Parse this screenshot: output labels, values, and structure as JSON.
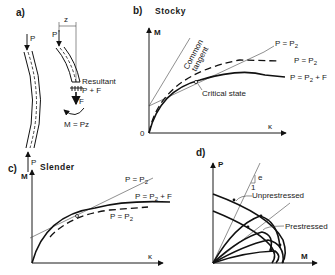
{
  "figure": {
    "panels": [
      {
        "id": "a",
        "label": "a)",
        "annotations": {
          "load_top_left": "P",
          "load_bottom_left": "P",
          "load_top_right": "P",
          "eccentricity": "z",
          "resultant": "Resultant",
          "resultant_value": "P + F",
          "force": "F",
          "moment": "M = Pz"
        }
      },
      {
        "id": "b",
        "label": "b)",
        "title": "Stocky",
        "y_axis": "M",
        "x_axis": "κ",
        "origin": "0",
        "tangent_label_line1": "Common",
        "tangent_label_line2": "tangent",
        "critical_label": "Critical state",
        "curve_labels": {
          "thin": "P = P",
          "thin_sub": "2",
          "dashed": "P = P",
          "dashed_sub": "2",
          "solid": "P = P",
          "solid_sub": "2",
          "solid_suffix": " + F"
        }
      },
      {
        "id": "c",
        "label": "c)",
        "title": "Slender",
        "y_axis": "M",
        "x_axis": "κ",
        "curve_labels": {
          "thin": "P = P",
          "thin_sub": "2",
          "solid": "P = P",
          "solid_sub": "2",
          "solid_suffix": " + F",
          "dashed": "P = P",
          "dashed_sub": "2"
        }
      },
      {
        "id": "d",
        "label": "d)",
        "y_axis": "P",
        "x_axis": "M",
        "slope_label": "e",
        "slope_unit": "1",
        "unprestressed": "Unprestressed",
        "prestressed": "Prestressed"
      }
    ]
  }
}
